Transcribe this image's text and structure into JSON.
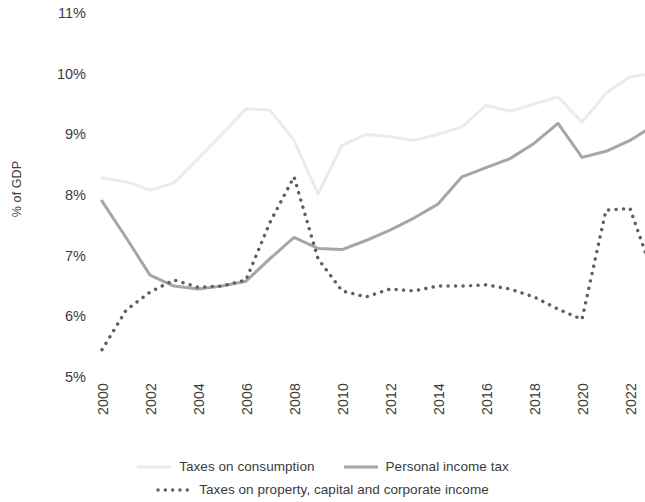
{
  "chart_data": {
    "type": "line",
    "title": "",
    "xlabel": "",
    "ylabel": "% of GDP",
    "ylim": [
      5,
      11
    ],
    "yticks": [
      11,
      10,
      9,
      8,
      7,
      6,
      5
    ],
    "ytick_labels": [
      "11%",
      "10%",
      "9%",
      "8%",
      "7%",
      "6%",
      "5%"
    ],
    "xlim": [
      2000,
      2023
    ],
    "xticks": [
      2000,
      2002,
      2004,
      2006,
      2008,
      2010,
      2012,
      2014,
      2016,
      2018,
      2020,
      2022
    ],
    "xtick_labels": [
      "2000",
      "2002",
      "2004",
      "2006",
      "2008",
      "2010",
      "2012",
      "2014",
      "2016",
      "2018",
      "2020",
      "2022"
    ],
    "grid": false,
    "legend_position": "bottom",
    "x": [
      2000,
      2001,
      2002,
      2003,
      2004,
      2005,
      2006,
      2007,
      2008,
      2009,
      2010,
      2011,
      2012,
      2013,
      2014,
      2015,
      2016,
      2017,
      2018,
      2019,
      2020,
      2021,
      2022,
      2023
    ],
    "series": [
      {
        "name": "Taxes on consumption",
        "style": "solid",
        "color": "#eceaea",
        "width": 3.0,
        "values": [
          8.28,
          8.22,
          8.08,
          8.2,
          8.6,
          9.0,
          9.42,
          9.4,
          8.9,
          8.02,
          8.82,
          9.0,
          8.96,
          8.9,
          9.0,
          9.12,
          9.48,
          9.38,
          9.5,
          9.62,
          9.2,
          9.68,
          9.95,
          10.0
        ]
      },
      {
        "name": "Personal income tax",
        "style": "solid",
        "color": "#a6a6a6",
        "width": 3.0,
        "values": [
          7.9,
          7.3,
          6.68,
          6.5,
          6.45,
          6.5,
          6.58,
          6.95,
          7.3,
          7.12,
          7.1,
          7.25,
          7.42,
          7.62,
          7.85,
          8.3,
          8.45,
          8.6,
          8.85,
          9.18,
          8.62,
          8.72,
          8.9,
          9.15
        ]
      },
      {
        "name": "Taxes on property, capital and corporate income",
        "style": "dotted",
        "color": "#5e5e5e",
        "width": 3.4,
        "values": [
          5.45,
          6.1,
          6.4,
          6.6,
          6.48,
          6.5,
          6.6,
          7.55,
          8.3,
          6.95,
          6.42,
          6.32,
          6.45,
          6.42,
          6.5,
          6.5,
          6.52,
          6.45,
          6.32,
          6.12,
          5.95,
          7.75,
          7.78,
          6.65
        ]
      }
    ]
  },
  "legend": {
    "items": [
      {
        "label": "Taxes on consumption",
        "marker": "line-light",
        "color": "#eceaea"
      },
      {
        "label": "Personal income tax",
        "marker": "line-gray",
        "color": "#a6a6a6"
      },
      {
        "label": "Taxes on property, capital and corporate income",
        "marker": "line-dotted",
        "color": "#5e5e5e"
      }
    ]
  }
}
